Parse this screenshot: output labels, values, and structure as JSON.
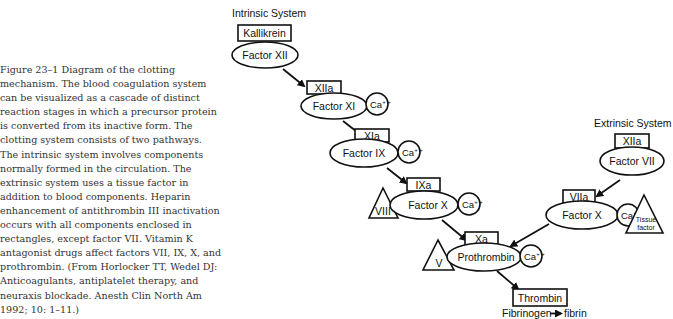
{
  "caption": {
    "figure_label": "Figure 23–1",
    "text": "Diagram of the clotting mechanism. The blood coagulation system can be visualized as a cascade of distinct reaction stages in which a precursor protein is converted from its inactive form. The clotting system consists of two pathways. The intrinsic system involves components normally formed in the circulation. The extrinsic system uses a tissue factor in addition to blood components. Heparin enhancement of antithrombin III inactivation occurs with all components enclosed in rectangles, except factor VII. Vitamin K antagonist drugs affect factors VII, IX, X, and prothrombin. (From Horlocker TT, Wedel DJ: Anticoagulants, antiplatelet therapy, and neuraxis blockade. Anesth Clin North Am 1992; 10: 1–11.)"
  },
  "diagram": {
    "intrinsic": {
      "title": "Intrinsic System",
      "kallikrein": "Kallikrein",
      "factor_xii": "Factor XII",
      "xiia": "XIIa",
      "factor_xi": "Factor XI",
      "xia": "XIa",
      "factor_ix": "Factor IX",
      "ixa": "IXa",
      "viii": "VIII",
      "factor_x": "Factor X"
    },
    "extrinsic": {
      "title": "Extrinsic System",
      "xiia": "XIIa",
      "factor_vii": "Factor VII",
      "viia": "VIIa",
      "factor_x": "Factor X",
      "tissue_factor_line1": "Tissue",
      "tissue_factor_line2": "factor"
    },
    "common": {
      "xa": "Xa",
      "v": "V",
      "prothrombin": "Prothrombin",
      "thrombin": "Thrombin",
      "fibrinogen": "Fibrinogen",
      "fibrin": "fibrin"
    },
    "calcium": {
      "symbol": "Ca",
      "charge": "+ +"
    }
  }
}
